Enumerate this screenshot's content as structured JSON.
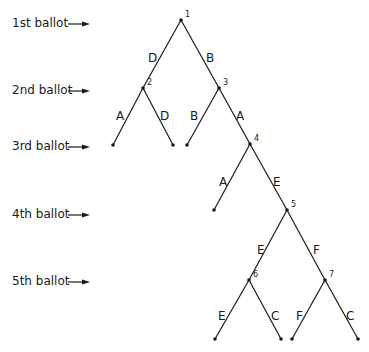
{
  "diagram": {
    "type": "voting-tree",
    "rows": [
      {
        "label": "1st  ballot",
        "y": 24
      },
      {
        "label": "2nd ballot",
        "y": 91
      },
      {
        "label": "3rd ballot",
        "y": 147
      },
      {
        "label": "4th ballot",
        "y": 215
      },
      {
        "label": "5th ballot",
        "y": 282
      }
    ],
    "nodes": [
      {
        "id": "1",
        "x": 181,
        "y": 20
      },
      {
        "id": "2",
        "x": 143,
        "y": 88
      },
      {
        "id": "3",
        "x": 219,
        "y": 88
      },
      {
        "id": "4",
        "x": 250,
        "y": 144
      },
      {
        "id": "5",
        "x": 287,
        "y": 210
      },
      {
        "id": "6",
        "x": 249,
        "y": 280
      },
      {
        "id": "7",
        "x": 325,
        "y": 280
      }
    ],
    "leaves": [
      {
        "id": "L1",
        "x": 113,
        "y": 145
      },
      {
        "id": "L2",
        "x": 173,
        "y": 145
      },
      {
        "id": "L3",
        "x": 187,
        "y": 145
      },
      {
        "id": "L4",
        "x": 214,
        "y": 210
      },
      {
        "id": "L5",
        "x": 215,
        "y": 339
      },
      {
        "id": "L6",
        "x": 281,
        "y": 339
      },
      {
        "id": "L7",
        "x": 292,
        "y": 339
      },
      {
        "id": "L8",
        "x": 358,
        "y": 339
      }
    ],
    "edges": [
      {
        "from": "1",
        "to": "2",
        "label": "D",
        "lx": 148,
        "ly": 52
      },
      {
        "from": "1",
        "to": "3",
        "label": "B",
        "lx": 206,
        "ly": 52
      },
      {
        "from": "2",
        "to": "L1",
        "label": "A",
        "lx": 116,
        "ly": 110
      },
      {
        "from": "2",
        "to": "L2",
        "label": "D",
        "lx": 160,
        "ly": 110
      },
      {
        "from": "3",
        "to": "L3",
        "label": "B",
        "lx": 190,
        "ly": 110
      },
      {
        "from": "3",
        "to": "4",
        "label": "A",
        "lx": 236,
        "ly": 110
      },
      {
        "from": "4",
        "to": "L4",
        "label": "A",
        "lx": 219,
        "ly": 176
      },
      {
        "from": "4",
        "to": "5",
        "label": "E",
        "lx": 273,
        "ly": 176
      },
      {
        "from": "5",
        "to": "6",
        "label": "E",
        "lx": 257,
        "ly": 244
      },
      {
        "from": "5",
        "to": "7",
        "label": "F",
        "lx": 313,
        "ly": 244
      },
      {
        "from": "6",
        "to": "L5",
        "label": "E",
        "lx": 218,
        "ly": 310
      },
      {
        "from": "6",
        "to": "L6",
        "label": "C",
        "lx": 271,
        "ly": 310
      },
      {
        "from": "7",
        "to": "L7",
        "label": "F",
        "lx": 296,
        "ly": 310
      },
      {
        "from": "7",
        "to": "L8",
        "label": "C",
        "lx": 346,
        "ly": 310
      }
    ],
    "colors": {
      "line": "#1a1a1a",
      "background": "#ffffff"
    }
  }
}
